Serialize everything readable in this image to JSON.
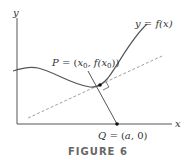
{
  "figure": {
    "caption": "FIGURE 6",
    "axes": {
      "x_label": "x",
      "y_label": "y"
    },
    "curve_label": {
      "lhs": "y",
      "eq": " = ",
      "rhs": "f(x)"
    },
    "point_p_label": {
      "name": "P",
      "eq": " = (",
      "x": "x",
      "x_sub": "0",
      "mid": ", f(x",
      "fx_sub": "0",
      "end": "))"
    },
    "point_q_label": {
      "name": "Q",
      "eq": " = (",
      "a": "a",
      "end": ", 0)"
    },
    "colors": {
      "curve": "#555555",
      "axis": "#555555",
      "tangent_dashed": "#888888",
      "normal": "#555555",
      "point": "#111111",
      "caption": "#666666"
    }
  }
}
